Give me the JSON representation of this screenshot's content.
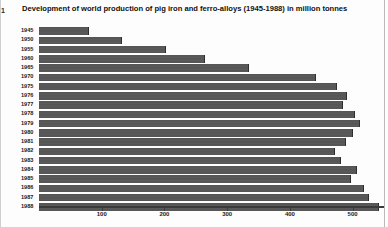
{
  "figure": {
    "corner_mark": "1",
    "title": "Development of world production of pig iron and ferro-alloys (1945-1988) in million tonnes"
  },
  "axis": {
    "tick_labels": [
      "100",
      "200",
      "300",
      "400",
      "500"
    ],
    "tick_values": [
      100,
      200,
      300,
      400,
      500
    ]
  },
  "colors": {
    "bar": "#565656",
    "bar_edge": "#2f2f2f",
    "axis": "#3a3a3a",
    "background": "#fdfdfd",
    "text": "#111111"
  },
  "chart_data": {
    "type": "bar",
    "orientation": "horizontal",
    "title": "Development of world production of pig iron and ferro-alloys (1945-1988) in million tonnes",
    "xlabel": "",
    "ylabel": "",
    "unit": "million tonnes",
    "xlim": [
      0,
      550
    ],
    "ylim": null,
    "grid": false,
    "legend": null,
    "categories": [
      "1945",
      "1950",
      "1955",
      "1960",
      "1965",
      "1970",
      "1975",
      "1976",
      "1977",
      "1978",
      "1979",
      "1980",
      "1981",
      "1982",
      "1983",
      "1984",
      "1985",
      "1986",
      "1987",
      "1988"
    ],
    "values": [
      78,
      131,
      201,
      263,
      333,
      440,
      473,
      489,
      483,
      502,
      510,
      499,
      488,
      470,
      480,
      505,
      496,
      516,
      524,
      540
    ]
  }
}
